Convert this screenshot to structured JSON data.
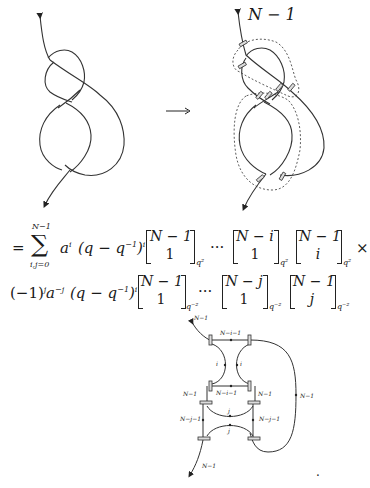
{
  "figure": {
    "arrow_label": "→",
    "right_knot_label": "N − 1"
  },
  "equation": {
    "line1": {
      "equals": "=",
      "sum_upper": "N−1",
      "sum_symbol": "∑",
      "sum_lower": "i,j=0",
      "term_a": "a",
      "term_a_exp": "i",
      "term_q": "(q − q",
      "term_q_exp_inner": "−1",
      "term_q_close": ")",
      "term_q_exp": "i",
      "binom1_top": "N − 1",
      "binom1_bot": "1",
      "binom1_sub": "q²",
      "dots": "···",
      "binom2_top": "N − i",
      "binom2_bot": "1",
      "binom2_sub": "q²",
      "binom3_top": "N − 1",
      "binom3_bot": "i",
      "binom3_sub": "q²",
      "times": "×"
    },
    "line2": {
      "sign": "(−1)",
      "sign_exp": "j",
      "term_a": "a",
      "term_a_exp": "−j",
      "term_q": "(q − q",
      "term_q_exp_inner": "−1",
      "term_q_close": ")",
      "term_q_exp": "i",
      "binom1_top": "N − 1",
      "binom1_bot": "1",
      "binom1_sub": "q⁻²",
      "dots": "···",
      "binom2_top": "N − j",
      "binom2_bot": "1",
      "binom2_sub": "q⁻²",
      "binom3_top": "N − 1",
      "binom3_bot": "j",
      "binom3_sub": "q⁻²"
    }
  },
  "web_diagram": {
    "labels": {
      "top_in": "N−1",
      "top_rung": "N−i−1",
      "left_i": "i",
      "right_i": "i",
      "mid_rung": "N−i−1",
      "left_n1": "N−1",
      "right_n1": "N−1",
      "upper_j": "j",
      "left_nj1": "N−j−1",
      "lower_j": "j",
      "right_nj1": "N−j−1",
      "outer_loop": "N−1",
      "bottom_out": "N−1"
    },
    "trailing_period": "."
  }
}
